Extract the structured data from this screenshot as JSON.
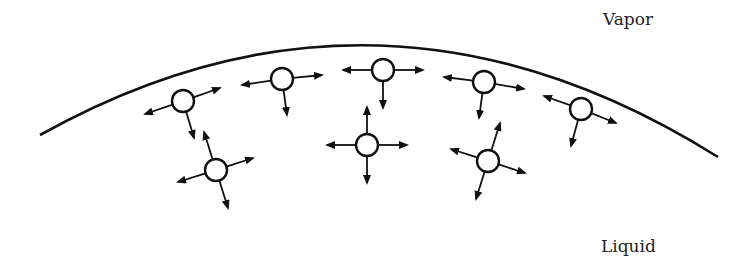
{
  "labels": {
    "vapor": "Vapor",
    "liquid": "Liquid"
  },
  "colors": {
    "stroke": "#111111",
    "background": "#ffffff",
    "text": "#222222"
  },
  "interface": {
    "description": "liquid-vapor interface curve",
    "start": [
      40,
      135
    ],
    "control": [
      380,
      -55
    ],
    "end": [
      718,
      157
    ]
  },
  "molecules": {
    "radius": 11,
    "surface": [
      {
        "cx": 183,
        "cy": 101,
        "arrows": [
          [
            -38,
            13
          ],
          [
            37,
            -13
          ],
          [
            11,
            37
          ]
        ]
      },
      {
        "cx": 282,
        "cy": 79,
        "arrows": [
          [
            -40,
            6
          ],
          [
            40,
            -4
          ],
          [
            5,
            36
          ]
        ]
      },
      {
        "cx": 383,
        "cy": 70,
        "arrows": [
          [
            -40,
            0
          ],
          [
            40,
            0
          ],
          [
            0,
            38
          ]
        ]
      },
      {
        "cx": 484,
        "cy": 82,
        "arrows": [
          [
            -40,
            -5
          ],
          [
            40,
            7
          ],
          [
            -5,
            36
          ]
        ]
      },
      {
        "cx": 581,
        "cy": 109,
        "arrows": [
          [
            -37,
            -13
          ],
          [
            35,
            14
          ],
          [
            -10,
            37
          ]
        ]
      }
    ],
    "bulk": [
      {
        "cx": 216,
        "cy": 170,
        "arrows": [
          [
            -38,
            12
          ],
          [
            37,
            -12
          ],
          [
            -12,
            -38
          ],
          [
            12,
            38
          ]
        ]
      },
      {
        "cx": 367,
        "cy": 145,
        "arrows": [
          [
            -40,
            0
          ],
          [
            40,
            0
          ],
          [
            0,
            -38
          ],
          [
            0,
            38
          ]
        ]
      },
      {
        "cx": 488,
        "cy": 161,
        "arrows": [
          [
            -37,
            -12
          ],
          [
            37,
            12
          ],
          [
            12,
            -38
          ],
          [
            -12,
            38
          ]
        ]
      }
    ]
  }
}
